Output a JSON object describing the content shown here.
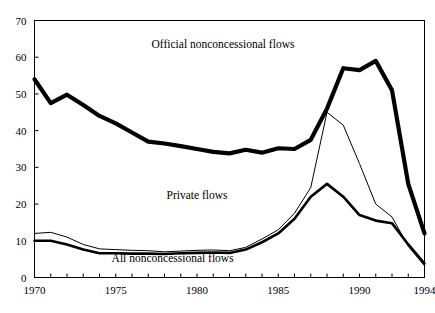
{
  "chart_data": {
    "type": "line",
    "title": "",
    "subtitle": "",
    "xlabel": "",
    "ylabel": "",
    "xlim": [
      1970,
      1994
    ],
    "ylim": [
      0,
      70
    ],
    "grid": false,
    "legend_position": "inline-annotations",
    "x": [
      1970,
      1971,
      1972,
      1973,
      1974,
      1975,
      1976,
      1977,
      1978,
      1979,
      1980,
      1981,
      1982,
      1983,
      1984,
      1985,
      1986,
      1987,
      1988,
      1989,
      1990,
      1991,
      1992,
      1993,
      1994
    ],
    "x_tick_labels": [
      "1970",
      "1975",
      "1980",
      "1985",
      "1990",
      "1994"
    ],
    "x_tick_values": [
      1970,
      1975,
      1980,
      1985,
      1990,
      1994
    ],
    "y_tick_labels": [
      "0",
      "10",
      "20",
      "30",
      "40",
      "50",
      "60",
      "70"
    ],
    "y_tick_values": [
      0,
      10,
      20,
      30,
      40,
      50,
      60,
      70
    ],
    "series": [
      {
        "name": "Official nonconcessional flows",
        "label": "Official nonconcessional flows",
        "style": "thick",
        "stroke_width": 4.2,
        "color": "#000000",
        "label_x": 1981.6,
        "label_y": 62.5,
        "values": [
          54.0,
          47.5,
          49.8,
          47.0,
          44.0,
          42.0,
          39.5,
          37.0,
          36.5,
          35.8,
          35.0,
          34.2,
          33.8,
          34.8,
          34.0,
          35.2,
          35.0,
          37.5,
          46.0,
          57.0,
          56.5,
          59.0,
          51.0,
          25.5,
          12.0
        ]
      },
      {
        "name": "Private flows",
        "label": "Private flows",
        "style": "thin",
        "stroke_width": 1.0,
        "color": "#000000",
        "label_x": 1980.0,
        "label_y": 21.5,
        "values": [
          12.0,
          12.3,
          11.0,
          9.0,
          7.8,
          7.6,
          7.4,
          7.3,
          7.0,
          7.2,
          7.4,
          7.5,
          7.3,
          8.2,
          10.5,
          13.0,
          17.5,
          24.5,
          45.0,
          41.5,
          31.0,
          20.0,
          16.5,
          8.5,
          3.2
        ]
      },
      {
        "name": "All nonconcessional flows",
        "label": "All nonconcessional flows",
        "style": "medium",
        "stroke_width": 2.6,
        "color": "#000000",
        "label_x": 1978.5,
        "label_y": 4.2,
        "values": [
          10.0,
          10.0,
          9.0,
          7.6,
          6.6,
          6.6,
          6.5,
          6.5,
          6.4,
          6.6,
          6.7,
          6.8,
          6.7,
          7.6,
          9.6,
          12.0,
          16.0,
          22.0,
          25.5,
          22.0,
          17.0,
          15.5,
          14.8,
          9.0,
          3.8
        ]
      }
    ]
  },
  "plot": {
    "frame_color": "#000000",
    "background": "#ffffff"
  }
}
